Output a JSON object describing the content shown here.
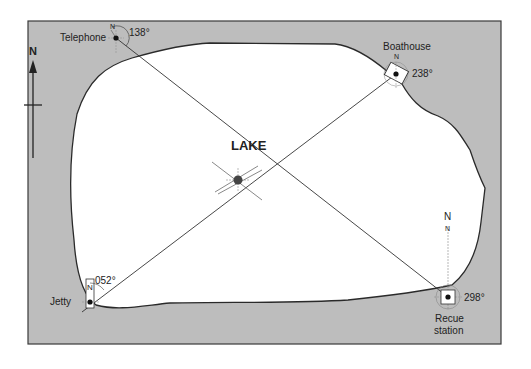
{
  "diagram": {
    "title": "LAKE",
    "north_arrow_label": "N",
    "colors": {
      "land": "#bdbdbd",
      "lake": "#ffffff",
      "outline": "#2a2a2a",
      "bearing_line": "#333333"
    },
    "stations": [
      {
        "name": "Telephone",
        "bearing": "138°",
        "north_label": "N"
      },
      {
        "name": "Boathouse",
        "bearing": "238°",
        "north_label": "N"
      },
      {
        "name": "Jetty",
        "bearing": "052°",
        "north_label": "N"
      },
      {
        "name_line1": "Recue",
        "name_line2": "station",
        "bearing": "298°",
        "north_label_outer": "N",
        "north_label_inner": "N"
      }
    ],
    "center_point": "intersection"
  }
}
